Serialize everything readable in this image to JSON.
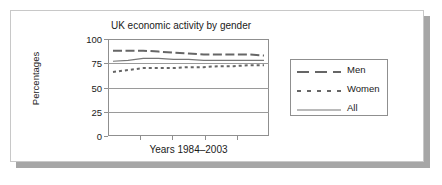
{
  "chart_data": {
    "type": "line",
    "title": "UK economic activity by gender",
    "xlabel": "Years 1984–2003",
    "ylabel": "Percentages",
    "ylim": [
      0,
      100
    ],
    "yticks": [
      100,
      75,
      50,
      25,
      0
    ],
    "ytick_labels": [
      "100",
      "75",
      "50",
      "25",
      "0"
    ],
    "grid": true,
    "legend_position": "right",
    "x": [
      1984,
      1986,
      1988,
      1990,
      1992,
      1994,
      1996,
      1998,
      2000,
      2002,
      2003
    ],
    "series": [
      {
        "name": "Men",
        "style": "long-dash",
        "color": "#666666",
        "values": [
          88,
          88,
          88,
          87,
          86,
          85,
          84,
          84,
          84,
          84,
          83
        ]
      },
      {
        "name": "Women",
        "style": "short-dash",
        "color": "#666666",
        "values": [
          66,
          68,
          70,
          70,
          70,
          71,
          71,
          72,
          72,
          73,
          73
        ]
      },
      {
        "name": "All",
        "style": "solid",
        "color": "#777777",
        "values": [
          77,
          78,
          80,
          80,
          79,
          79,
          78,
          78,
          78,
          78,
          78
        ]
      }
    ]
  },
  "legend": {
    "entries": [
      {
        "label": "Men"
      },
      {
        "label": "Women"
      },
      {
        "label": "All"
      }
    ]
  },
  "colors": {
    "panel_background": "#ffffff",
    "panel_border": "#c8c8c8",
    "shadow": "#a6a6a6",
    "axis": "#8f8f8f",
    "gridline": "#9a9a9a",
    "text": "#1a1a1a",
    "series": "#666666"
  }
}
